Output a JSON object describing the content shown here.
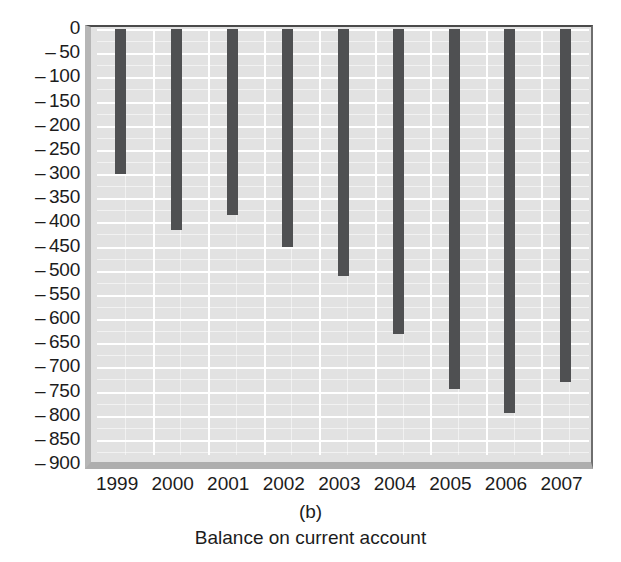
{
  "chart_data": {
    "type": "bar",
    "title": "Balance on current account",
    "panel_label": "(b)",
    "xlabel": "",
    "ylabel": "",
    "categories": [
      "1999",
      "2000",
      "2001",
      "2002",
      "2003",
      "2004",
      "2005",
      "2006",
      "2007"
    ],
    "values": [
      -300,
      -415,
      -385,
      -450,
      -510,
      -630,
      -745,
      -795,
      -730
    ],
    "ylim": [
      -900,
      0
    ],
    "ytick_step": 50,
    "yticks": [
      0,
      -50,
      -100,
      -150,
      -200,
      -250,
      -300,
      -350,
      -400,
      -450,
      -500,
      -550,
      -600,
      -650,
      -700,
      -750,
      -800,
      -850,
      -900
    ],
    "ytick_labels": [
      "0",
      "– 50",
      "– 100",
      "– 150",
      "– 200",
      "– 250",
      "– 300",
      "– 350",
      "– 400",
      "– 450",
      "– 500",
      "– 550",
      "– 600",
      "– 650",
      "– 700",
      "– 750",
      "– 800",
      "– 850",
      "– 900"
    ],
    "grid": true,
    "legend": "none",
    "bar_color": "#4f5052",
    "plot_background": "#e2e2e2",
    "gridline_color": "#ffffff"
  },
  "figure": {
    "panel_label": "(b)",
    "caption": "Balance on current account"
  }
}
